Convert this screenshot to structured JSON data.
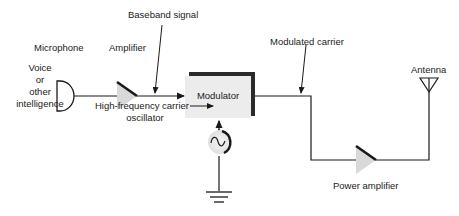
{
  "diagram": {
    "labels": {
      "microphone": "Microphone",
      "source_line1": "Voice",
      "source_line2": "or",
      "source_line3": "other",
      "source_line4": "intelligence",
      "amplifier": "Amplifier",
      "baseband": "Baseband signal",
      "modulator": "Modulator",
      "oscillator_line1": "High-frequency carrier",
      "oscillator_line2": "oscillator",
      "modulated": "Modulated carrier",
      "power_amplifier": "Power amplifier",
      "antenna": "Antenna"
    },
    "nodes": [
      {
        "id": "microphone",
        "label": "Microphone"
      },
      {
        "id": "amplifier",
        "label": "Amplifier"
      },
      {
        "id": "modulator",
        "label": "Modulator"
      },
      {
        "id": "oscillator",
        "label": "High-frequency carrier oscillator"
      },
      {
        "id": "ground",
        "label": ""
      },
      {
        "id": "power_amplifier",
        "label": "Power amplifier"
      },
      {
        "id": "antenna",
        "label": "Antenna"
      }
    ],
    "edges": [
      {
        "from": "microphone",
        "to": "amplifier"
      },
      {
        "from": "amplifier",
        "to": "modulator",
        "label": "Baseband signal"
      },
      {
        "from": "oscillator",
        "to": "modulator"
      },
      {
        "from": "oscillator",
        "to": "ground"
      },
      {
        "from": "modulator",
        "to": "power_amplifier",
        "label": "Modulated carrier"
      },
      {
        "from": "power_amplifier",
        "to": "antenna"
      }
    ],
    "colors": {
      "line": "#1a1a1a",
      "block_fill": "#ececec",
      "block_shadow": "#2a2a2a",
      "amp_fill": "#d9d9d9"
    }
  }
}
